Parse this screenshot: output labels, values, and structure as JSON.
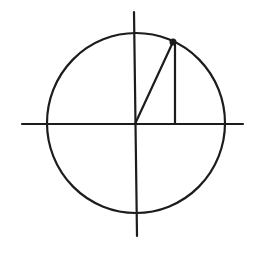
{
  "diagram": {
    "type": "unit-circle-sketch",
    "stroke_color": "#1c1c1c",
    "background": "#ffffff",
    "circle": {
      "cx": 136,
      "cy": 123,
      "rx": 89,
      "ry": 90
    },
    "x_axis": {
      "x1": 22,
      "y1": 124,
      "x2": 243,
      "y2": 124
    },
    "y_axis": {
      "x1": 134,
      "y1": 12,
      "x2": 137,
      "y2": 236
    },
    "radius_line": {
      "x1": 135,
      "y1": 124,
      "x2": 173,
      "y2": 42
    },
    "drop_line": {
      "x1": 175,
      "y1": 44,
      "x2": 175,
      "y2": 124
    },
    "point": {
      "cx": 173,
      "cy": 42,
      "r": 3.5
    }
  }
}
